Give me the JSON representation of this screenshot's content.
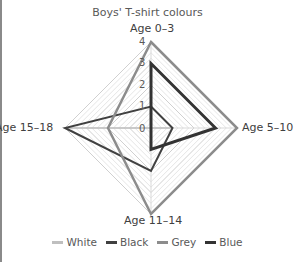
{
  "chart_data": {
    "type": "radar",
    "title": "Boys' T-shirt colours",
    "categories": [
      "Age 0–3",
      "Age 5–10",
      "Age 11–14",
      "Age 15–18"
    ],
    "tick_labels": [
      "0",
      "1",
      "2",
      "3",
      "4"
    ],
    "rlim": [
      0,
      4
    ],
    "grid": true,
    "legend_position": "bottom",
    "series": [
      {
        "name": "White",
        "values": [
          0,
          1,
          0,
          4
        ],
        "color": "#bfbfbf",
        "width": 1.5
      },
      {
        "name": "Black",
        "values": [
          1,
          1,
          2,
          4
        ],
        "color": "#404040",
        "width": 2
      },
      {
        "name": "Grey",
        "values": [
          4,
          4,
          4,
          2
        ],
        "color": "#8c8c8c",
        "width": 2.5
      },
      {
        "name": "Blue",
        "values": [
          3,
          3,
          1,
          0
        ],
        "color": "#333333",
        "width": 3
      }
    ]
  },
  "labels": {
    "title": "Boys' T-shirt colours",
    "axis_top": "Age 0–3",
    "axis_right": "Age 5–10",
    "axis_bottom": "Age 11–14",
    "axis_left": "Age 15–18",
    "tick_0": "0",
    "tick_1": "1",
    "tick_2": "2",
    "tick_3": "3",
    "tick_4": "4"
  },
  "legend": {
    "items": [
      {
        "label": "White",
        "color": "#bfbfbf"
      },
      {
        "label": "Black",
        "color": "#404040"
      },
      {
        "label": "Grey",
        "color": "#8c8c8c"
      },
      {
        "label": "Blue",
        "color": "#333333"
      }
    ]
  }
}
